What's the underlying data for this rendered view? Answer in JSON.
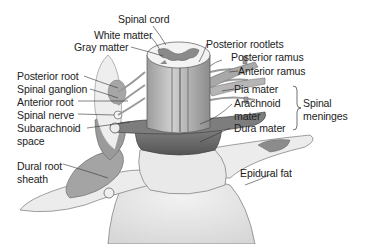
{
  "figure": {
    "colors": {
      "background": "#ffffff",
      "label_text": "#222222",
      "leader_line": "#333333",
      "cord": "#bdbdbd",
      "gray_matter": "#8a8a8a",
      "dura": "#6e6e6e",
      "vertebra": "#e6e6e6",
      "root_sheath": "#9a9a9a",
      "ganglion_halo": "#f0f0f0"
    },
    "labels": {
      "spinal_cord": "Spinal cord",
      "white_matter": "White matter",
      "gray_matter": "Gray matter",
      "posterior_rootlets": "Posterior rootlets",
      "posterior_ramus": "Posterior ramus",
      "anterior_ramus": "Anterior ramus",
      "pia_mater": "Pia mater",
      "arachnoid_mater_line1": "Arachnoid",
      "arachnoid_mater_line2": "mater",
      "dura_mater": "Dura mater",
      "spinal_meninges_line1": "Spinal",
      "spinal_meninges_line2": "meninges",
      "posterior_root": "Posterior root",
      "spinal_ganglion": "Spinal ganglion",
      "anterior_root": "Anterior root",
      "spinal_nerve": "Spinal nerve",
      "subarachnoid_space_line1": "Subarachnoid",
      "subarachnoid_space_line2": "space",
      "dural_root_sheath_line1": "Dural root",
      "dural_root_sheath_line2": "sheath",
      "epidural_fat": "Epidural fat"
    }
  }
}
